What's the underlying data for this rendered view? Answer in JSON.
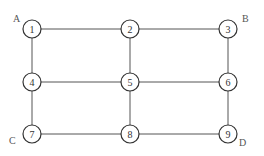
{
  "diagram": {
    "type": "grid-graph",
    "nodes": [
      {
        "id": "1",
        "label": "1",
        "x": 32,
        "y": 29
      },
      {
        "id": "2",
        "label": "2",
        "x": 130,
        "y": 29
      },
      {
        "id": "3",
        "label": "3",
        "x": 228,
        "y": 29
      },
      {
        "id": "4",
        "label": "4",
        "x": 32,
        "y": 82
      },
      {
        "id": "5",
        "label": "5",
        "x": 130,
        "y": 82
      },
      {
        "id": "6",
        "label": "6",
        "x": 228,
        "y": 82
      },
      {
        "id": "7",
        "label": "7",
        "x": 32,
        "y": 134
      },
      {
        "id": "8",
        "label": "8",
        "x": 130,
        "y": 134
      },
      {
        "id": "9",
        "label": "9",
        "x": 228,
        "y": 134
      }
    ],
    "edges": [
      [
        "1",
        "2"
      ],
      [
        "2",
        "3"
      ],
      [
        "4",
        "5"
      ],
      [
        "5",
        "6"
      ],
      [
        "7",
        "8"
      ],
      [
        "8",
        "9"
      ],
      [
        "1",
        "4"
      ],
      [
        "4",
        "7"
      ],
      [
        "2",
        "5"
      ],
      [
        "5",
        "8"
      ],
      [
        "3",
        "6"
      ],
      [
        "6",
        "9"
      ]
    ],
    "corner_labels": [
      {
        "label": "A",
        "node": "1",
        "x": 13,
        "y": 22
      },
      {
        "label": "B",
        "node": "3",
        "x": 242,
        "y": 22
      },
      {
        "label": "C",
        "node": "7",
        "x": 9,
        "y": 144
      },
      {
        "label": "D",
        "node": "9",
        "x": 239,
        "y": 146
      }
    ]
  }
}
